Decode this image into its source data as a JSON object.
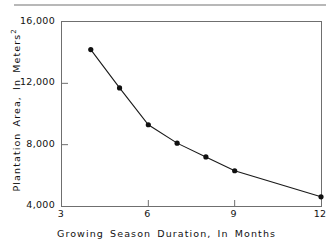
{
  "figure": {
    "background_color": "#ffffff",
    "line_color": "#1a1a1a",
    "marker_color": "#111111",
    "frame_color": "#6f6f6f",
    "rule_color": "#b8b8b8"
  },
  "chart_data": {
    "type": "line",
    "title": "",
    "xlabel": "Growing Season Duration, In Months",
    "ylabel_text": "Plantation Area, In Meters",
    "ylabel_superscript": "2",
    "x": [
      4,
      5,
      6,
      7,
      8,
      9,
      12
    ],
    "values": [
      14200,
      11700,
      9300,
      8100,
      7200,
      6300,
      4600
    ],
    "series": [
      {
        "name": "Plantation Area",
        "x": [
          4,
          5,
          6,
          7,
          8,
          9,
          12
        ],
        "values": [
          14200,
          11700,
          9300,
          8100,
          7200,
          6300,
          4600
        ]
      }
    ],
    "xlim": [
      3,
      12
    ],
    "ylim": [
      4000,
      16000
    ],
    "xticks": [
      3,
      6,
      9,
      12
    ],
    "xtick_labels": [
      "3",
      "6",
      "9",
      "12"
    ],
    "yticks": [
      4000,
      8000,
      12000,
      16000
    ],
    "ytick_labels": [
      "4,000",
      "8,000",
      "12,000",
      "16,000"
    ],
    "grid": false,
    "legend": false,
    "legend_position": "none",
    "marker": "filled-circle",
    "marker_size": 5
  }
}
